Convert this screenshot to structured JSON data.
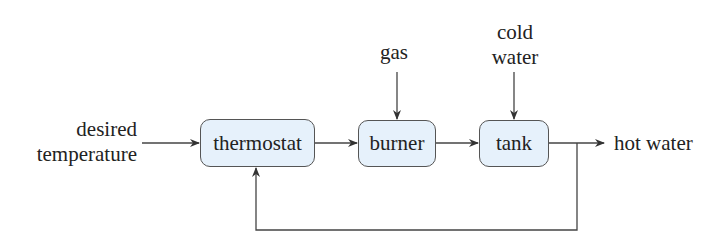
{
  "diagram": {
    "type": "block-diagram",
    "title": "",
    "blocks": [
      {
        "id": "thermostat",
        "label": "thermostat"
      },
      {
        "id": "burner",
        "label": "burner"
      },
      {
        "id": "tank",
        "label": "tank"
      }
    ],
    "inputs": {
      "desired_temperature": {
        "line1": "desired",
        "line2": "temperature"
      },
      "gas": {
        "label": "gas"
      },
      "cold_water": {
        "line1": "cold",
        "line2": "water"
      }
    },
    "outputs": {
      "hot_water": {
        "label": "hot water"
      }
    },
    "edges": [
      {
        "from": "desired temperature",
        "to": "thermostat"
      },
      {
        "from": "thermostat",
        "to": "burner"
      },
      {
        "from": "gas",
        "to": "burner"
      },
      {
        "from": "burner",
        "to": "tank"
      },
      {
        "from": "cold water",
        "to": "tank"
      },
      {
        "from": "tank",
        "to": "hot water"
      },
      {
        "from": "tank output",
        "to": "thermostat",
        "kind": "feedback"
      }
    ],
    "colors": {
      "block_fill": "#e6f1fb",
      "block_border": "#555555",
      "line": "#444444"
    }
  }
}
